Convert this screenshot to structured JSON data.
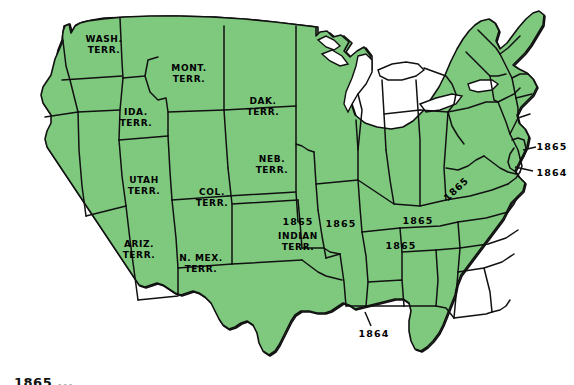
{
  "figure": {
    "kind": "historical-map",
    "region": "contiguous-united-states",
    "era_note": "1865",
    "colors": {
      "land_fill": "#7fc97f",
      "land_fill_light": "#8fd08c",
      "border_stroke": "#111111",
      "background": "#ffffff",
      "label_text": "#000000"
    }
  },
  "caption": {
    "text": "1865 ..."
  },
  "territory_labels": [
    {
      "id": "washington-territory",
      "text": "WASH.\nTERR.",
      "x": 104,
      "y": 45
    },
    {
      "id": "montana-territory",
      "text": "MONT.\nTERR.",
      "x": 189,
      "y": 74
    },
    {
      "id": "idaho-territory",
      "text": "IDA.\nTERR.",
      "x": 136,
      "y": 118
    },
    {
      "id": "dakota-territory",
      "text": "DAK.\nTERR.",
      "x": 263,
      "y": 107
    },
    {
      "id": "nebraska-territory",
      "text": "NEB.\nTERR.",
      "x": 272,
      "y": 165
    },
    {
      "id": "utah-territory",
      "text": "UTAH\nTERR.",
      "x": 144,
      "y": 186
    },
    {
      "id": "colorado-territory",
      "text": "COL.\nTERR.",
      "x": 212,
      "y": 198
    },
    {
      "id": "arizona-territory",
      "text": "ARIZ.\nTERR.",
      "x": 139,
      "y": 250
    },
    {
      "id": "new-mexico-territory",
      "text": "N. MEX.\nTERR.",
      "x": 201,
      "y": 264
    },
    {
      "id": "indian-territory",
      "text": "INDIAN\nTERR.",
      "x": 298,
      "y": 242
    }
  ],
  "year_labels": [
    {
      "id": "year-indian-territory",
      "text": "1865",
      "x": 298,
      "y": 221,
      "rotated": false
    },
    {
      "id": "year-kansas",
      "text": "1865",
      "x": 340,
      "y": 223,
      "rotated": false
    },
    {
      "id": "year-missouri",
      "text": "1865",
      "x": 340,
      "y": 223,
      "rotated": false
    },
    {
      "id": "year-kentucky",
      "text": "1865",
      "x": 412,
      "y": 219,
      "rotated": false
    },
    {
      "id": "year-tennessee",
      "text": "1865",
      "x": 400,
      "y": 245,
      "rotated": false
    },
    {
      "id": "year-west-virginia",
      "text": "1865",
      "x": 455,
      "y": 188,
      "rotated": true
    },
    {
      "id": "year-delaware",
      "text": "1865",
      "x": 549,
      "y": 146,
      "rotated": false
    },
    {
      "id": "year-maryland",
      "text": "1864",
      "x": 549,
      "y": 172,
      "rotated": false
    },
    {
      "id": "year-louisiana",
      "text": "1864",
      "x": 371,
      "y": 333,
      "rotated": false
    }
  ],
  "year_labels_visible": [
    {
      "id": "label-illinois-1865",
      "text": "1865",
      "x": 341,
      "y": 223
    },
    {
      "id": "label-kentucky-1865",
      "text": "1865",
      "x": 418,
      "y": 220
    },
    {
      "id": "label-tennessee-1865",
      "text": "1865",
      "x": 401,
      "y": 245
    },
    {
      "id": "label-westvirginia-1865",
      "text": "1865",
      "x": 456,
      "y": 189
    },
    {
      "id": "label-delaware-1865",
      "text": "1865",
      "x": 549,
      "y": 146
    },
    {
      "id": "label-maryland-1864",
      "text": "1864",
      "x": 549,
      "y": 172
    },
    {
      "id": "label-louisiana-1864",
      "text": "1864",
      "x": 371,
      "y": 333
    },
    {
      "id": "label-indianterr-1865",
      "text": "1865",
      "x": 298,
      "y": 221
    }
  ],
  "leader_lines": [
    {
      "id": "leader-delaware",
      "x1": 524,
      "y1": 150,
      "x2": 537,
      "y2": 148
    },
    {
      "id": "leader-maryland",
      "x1": 518,
      "y1": 168,
      "x2": 534,
      "y2": 171
    },
    {
      "id": "leader-louisiana",
      "x1": 366,
      "y1": 313,
      "x2": 371,
      "y2": 325
    }
  ]
}
